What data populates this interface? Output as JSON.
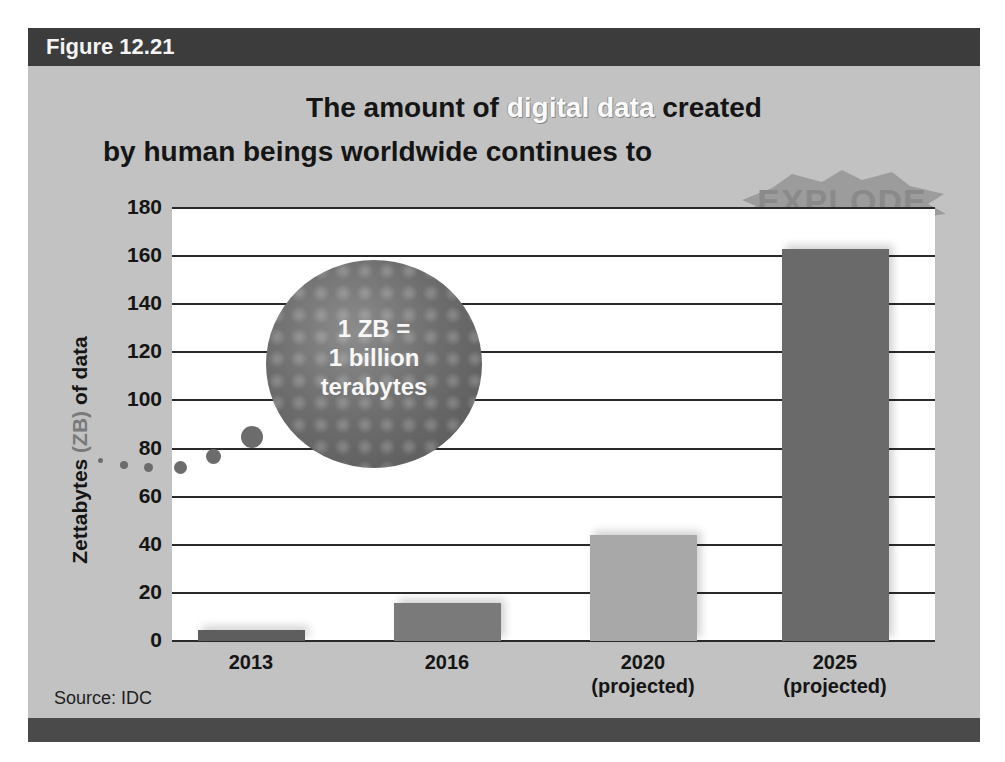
{
  "figure": {
    "label": "Figure 12.21",
    "title_line1_before": "The amount of ",
    "title_line1_highlight": "digital data",
    "title_line1_after": " created",
    "title_line2": "by human beings worldwide continues to",
    "title_burst": "EXPLODE",
    "callout": {
      "line1": "1 ZB =",
      "line2": "1 billion",
      "line3": "terabytes"
    },
    "source": "Source: IDC"
  },
  "colors": {
    "header_bar": "#3c3c3c",
    "panel_bg": "#c2c2c2",
    "bar_2013": "#5e5e5e",
    "bar_2016": "#7a7a7a",
    "bar_2020": "#a8a8a8",
    "bar_2025": "#6a6a6a"
  },
  "chart_data": {
    "type": "bar",
    "title": "The amount of digital data created by human beings worldwide continues to EXPLODE",
    "xlabel": "",
    "ylabel": "Zettabytes (ZB) of data",
    "ylabel_parts": {
      "prefix": "Zettabytes ",
      "zb": "(ZB)",
      "suffix": " of data"
    },
    "categories": [
      "2013",
      "2016",
      "2020 (projected)",
      "2025 (projected)"
    ],
    "category_lines": [
      [
        "2013",
        ""
      ],
      [
        "2016",
        ""
      ],
      [
        "2020",
        "(projected)"
      ],
      [
        "2025",
        "(projected)"
      ]
    ],
    "values": [
      4.4,
      16,
      44,
      163
    ],
    "ylim": [
      0,
      180
    ],
    "yticks": [
      "180",
      "160",
      "140",
      "120",
      "100",
      "80",
      "60",
      "40",
      "20",
      "0"
    ],
    "grid": true,
    "legend": null,
    "annotations": [
      "1 ZB = 1 billion terabytes"
    ],
    "source": "Source: IDC"
  }
}
